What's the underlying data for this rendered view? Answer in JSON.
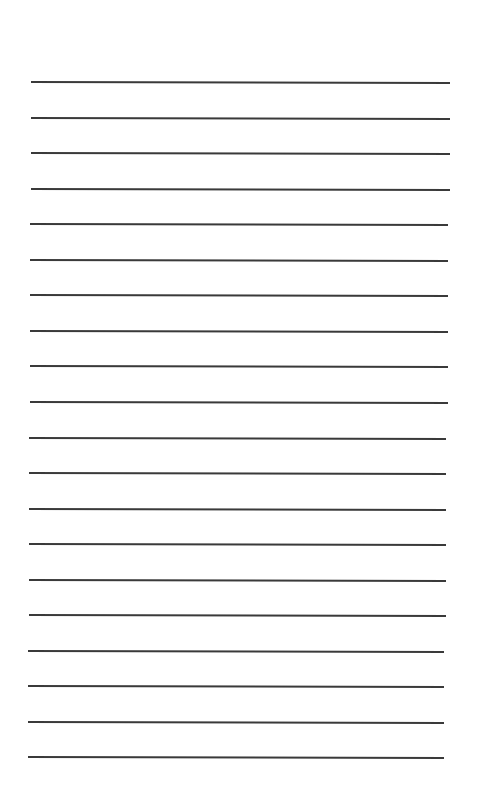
{
  "page": {
    "type": "lined-paper",
    "line_color": "#3a3a3a",
    "background": "#ffffff",
    "line_count": 20,
    "first_line_y": 81,
    "line_spacing": 35.55,
    "left_start_top": 31,
    "right_end_top": 450,
    "left_start_bottom": 5,
    "right_end_bottom": 444,
    "skew_deg": 0.15
  }
}
